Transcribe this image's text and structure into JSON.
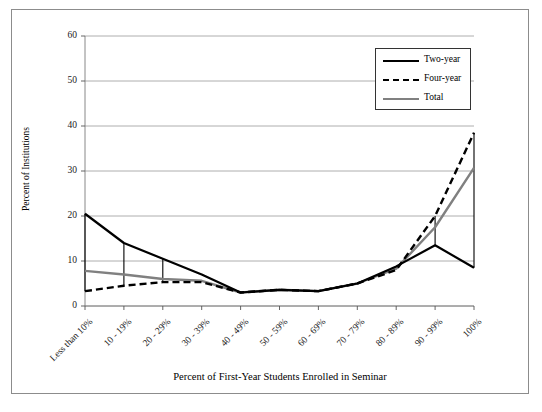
{
  "chart_data": {
    "type": "line",
    "title": "",
    "xlabel": "Percent of First-Year Students Enrolled in Seminar",
    "ylabel": "Percent of Institutions",
    "categories": [
      "Less than 10%",
      "10 - 19%",
      "20 - 29%",
      "30 - 39%",
      "40 - 49%",
      "50 - 59%",
      "60 - 69%",
      "70 - 79%",
      "80 - 89%",
      "90 - 99%",
      "100%"
    ],
    "series": [
      {
        "name": "Two-year",
        "color": "#000000",
        "style": "solid",
        "values": [
          20.5,
          14.0,
          10.5,
          7.0,
          3.0,
          3.6,
          3.3,
          5.0,
          8.8,
          13.5,
          8.5
        ]
      },
      {
        "name": "Four-year",
        "color": "#000000",
        "style": "dashed",
        "values": [
          3.3,
          4.5,
          5.3,
          5.3,
          3.0,
          3.6,
          3.3,
          5.0,
          8.0,
          20.0,
          38.5
        ]
      },
      {
        "name": "Total",
        "color": "#808080",
        "style": "solid",
        "values": [
          7.8,
          7.0,
          6.0,
          5.6,
          3.0,
          3.6,
          3.3,
          5.0,
          8.3,
          17.5,
          30.7
        ]
      }
    ],
    "dropline_categories": [
      "Less than 10%",
      "10 - 19%",
      "20 - 29%",
      "90 - 99%",
      "100%"
    ],
    "ylim": [
      0,
      60
    ],
    "yticks": [
      0,
      10,
      20,
      30,
      40,
      50,
      60
    ],
    "ytick_labels": [
      "0",
      "10",
      "20",
      "30",
      "40",
      "50",
      "60"
    ],
    "grid": "horizontal",
    "legend_position": "top-right",
    "legend_entries": [
      "Two-year",
      "Four-year",
      "Total"
    ]
  },
  "axis": {
    "y_title": "Percent of Institutions",
    "x_title": "Percent of First-Year Students Enrolled in Seminar"
  }
}
